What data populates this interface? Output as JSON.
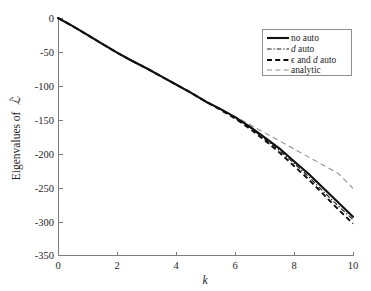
{
  "chart_data": {
    "type": "line",
    "title": "",
    "xlabel": "k",
    "ylabel": "Eigenvalues of L̂",
    "ylabel_plain": "Eigenvalues of L-hat",
    "xlim": [
      0,
      10
    ],
    "ylim": [
      -350,
      0
    ],
    "xticks": [
      0,
      2,
      4,
      6,
      8,
      10
    ],
    "xticklabels": [
      "0",
      "2",
      "4",
      "6",
      "8",
      "10"
    ],
    "yticks": [
      0,
      -50,
      -100,
      -150,
      -200,
      -250,
      -300,
      -350
    ],
    "yticklabels": [
      "0",
      "-50",
      "-100",
      "-150",
      "-200",
      "-250",
      "-300",
      "-350"
    ],
    "grid": false,
    "legend_position": "upper right",
    "x": [
      0,
      0.5,
      1,
      1.5,
      2,
      2.5,
      3,
      3.5,
      4,
      4.5,
      5,
      5.5,
      6,
      6.5,
      7,
      7.5,
      8,
      8.5,
      9,
      9.5,
      10
    ],
    "series": [
      {
        "name": "no auto",
        "style": "solid",
        "linewidth": 2.1,
        "color": "#101010",
        "values": [
          0,
          -12,
          -25,
          -38,
          -51,
          -63,
          -74,
          -86,
          -98,
          -110,
          -123,
          -134,
          -146,
          -160,
          -176,
          -192,
          -211,
          -230,
          -251,
          -272,
          -293
        ]
      },
      {
        "name": "d auto",
        "style": "dashdot",
        "linewidth": 1.15,
        "color": "#1a1a1a",
        "values": [
          0,
          -12,
          -25,
          -38,
          -51,
          -63,
          -74,
          -86,
          -98,
          -110,
          -123,
          -134,
          -147,
          -161,
          -178,
          -195,
          -214,
          -234,
          -256,
          -277,
          -297
        ]
      },
      {
        "name": "ε and d auto",
        "style": "dashed",
        "linewidth": 1.9,
        "color": "#0d0d0d",
        "values": [
          0,
          -12,
          -25,
          -38,
          -51,
          -63,
          -74,
          -86,
          -98,
          -110,
          -123,
          -135,
          -148,
          -163,
          -180,
          -198,
          -218,
          -238,
          -260,
          -282,
          -303
        ]
      },
      {
        "name": "analytic",
        "style": "dashed-thin",
        "linewidth": 1.05,
        "color": "#8c8c8c",
        "values": [
          0,
          -13,
          -26,
          -38,
          -50,
          -62,
          -74,
          -86,
          -98,
          -110,
          -122,
          -134,
          -145,
          -157,
          -169,
          -181,
          -193,
          -205,
          -217,
          -229,
          -251
        ]
      }
    ]
  },
  "axes": {
    "y_label": "Eigenvalues of",
    "y_label_symbol": "ℒ",
    "x_label": "k"
  },
  "legend": {
    "entries": [
      {
        "label": "no auto",
        "icon": "solid-line-swatch"
      },
      {
        "label_pre": "",
        "label_italic": "d",
        "label_post": " auto",
        "label": "d auto",
        "icon": "dash-dot-line-swatch"
      },
      {
        "label_pre": "ϵ and ",
        "label_italic": "d",
        "label_post": " auto",
        "label": "ϵ and d auto",
        "icon": "dashed-thick-line-swatch"
      },
      {
        "label": "analytic",
        "icon": "dashed-thin-line-swatch"
      }
    ]
  },
  "colors": {
    "axis": "#7d7d7d",
    "text": "#1c1c1c",
    "no_auto": "#101010",
    "d_auto": "#1a1a1a",
    "eps_d_auto": "#0d0d0d",
    "analytic": "#8c8c8c",
    "legend_border": "#8e8e8e",
    "background": "#ffffff"
  }
}
